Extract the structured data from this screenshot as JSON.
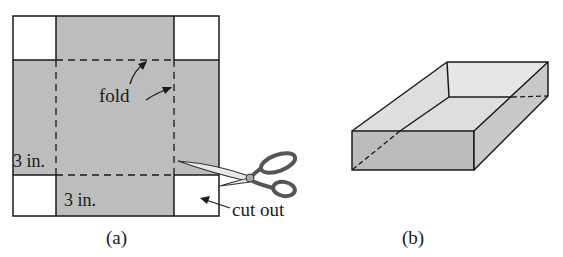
{
  "figure_a": {
    "caption": "(a)",
    "labels": {
      "fold": "fold",
      "side_length": "3 in.",
      "bottom_length": "3 in.",
      "cut_out": "cut out"
    }
  },
  "figure_b": {
    "caption": "(b)"
  },
  "colors": {
    "shaded": "#bdbdbd",
    "box_top": "#dedede",
    "box_front": "#bcbcbc",
    "box_side": "#c8c8c8",
    "box_inner_back": "#e6e6e6",
    "line": "#1a1a1a"
  }
}
